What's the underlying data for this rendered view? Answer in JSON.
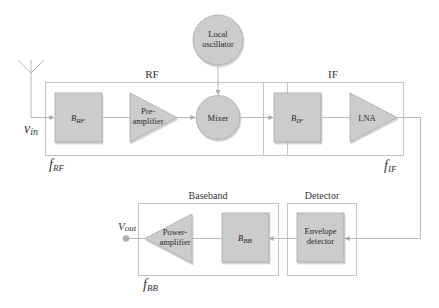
{
  "colors": {
    "block_fill": "#cccccc",
    "block_stroke": "#9a9a9a",
    "group_stroke": "#c4c4c4",
    "wire": "#b8b8b8",
    "text": "#333333",
    "background": "#ffffff"
  },
  "groups": {
    "rf": {
      "title": "RF",
      "freq_main": "f",
      "freq_sub": "RF"
    },
    "if": {
      "title": "IF",
      "freq_main": "f",
      "freq_sub": "IF"
    },
    "baseband": {
      "title": "Baseband",
      "freq_main": "f",
      "freq_sub": "BB"
    },
    "detector": {
      "title": "Detector"
    }
  },
  "blocks": {
    "b_rf": {
      "main": "B",
      "sub": "RF",
      "shape": "square"
    },
    "preamp": {
      "line1": "Pre-",
      "line2": "amplifier",
      "shape": "triangle-right"
    },
    "mixer": {
      "label": "Mixer",
      "shape": "circle"
    },
    "local_osc": {
      "line1": "Local",
      "line2": "oscillator",
      "shape": "circle"
    },
    "b_if": {
      "main": "B",
      "sub": "IF",
      "shape": "square"
    },
    "lna": {
      "label": "LNA",
      "shape": "triangle-right"
    },
    "envelope": {
      "line1": "Envelope",
      "line2": "detector",
      "shape": "square"
    },
    "b_bb": {
      "main": "B",
      "sub": "BB",
      "shape": "square"
    },
    "power_amp": {
      "line1": "Power-",
      "line2": "amplifier",
      "shape": "triangle-left"
    }
  },
  "signals": {
    "input": {
      "main": "v",
      "sub": "in"
    },
    "output": {
      "main": "V",
      "sub": "out"
    }
  },
  "icons": {
    "antenna": "antenna-icon",
    "output_terminal": "output-terminal-icon"
  }
}
